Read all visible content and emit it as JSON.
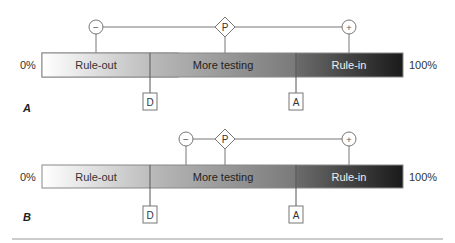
{
  "panels": [
    {
      "id": "A",
      "label": "A",
      "left_label": "0%",
      "right_label": "100%",
      "zones": [
        {
          "name": "Rule-out"
        },
        {
          "name": "More testing"
        },
        {
          "name": "Rule-in"
        }
      ],
      "markers": {
        "negative": "−",
        "pretest": "P",
        "positive": "+",
        "testing_threshold": "D",
        "treatment_threshold": "A"
      }
    },
    {
      "id": "B",
      "label": "B",
      "left_label": "0%",
      "right_label": "100%",
      "zones": [
        {
          "name": "Rule-out"
        },
        {
          "name": "More testing"
        },
        {
          "name": "Rule-in"
        }
      ],
      "markers": {
        "negative": "−",
        "pretest": "P",
        "positive": "+",
        "testing_threshold": "D",
        "treatment_threshold": "A"
      }
    }
  ],
  "colors": {
    "bar_light": "#ffffff",
    "bar_mid": "#a8a8a8",
    "bar_dark": "#1e1e1e",
    "line": "#666666"
  }
}
